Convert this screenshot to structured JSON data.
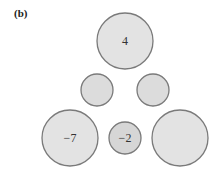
{
  "figure": {
    "label": "(b)",
    "stroke_color": "#7a7a7a",
    "fill_color": "#e2e2e2",
    "fill_color_small_dark": "#d6d6d6",
    "circles": [
      {
        "id": "top",
        "cx": 125,
        "cy": 41,
        "r": 28,
        "value": "4"
      },
      {
        "id": "middle-left",
        "cx": 97,
        "cy": 90,
        "r": 16,
        "value": ""
      },
      {
        "id": "middle-right",
        "cx": 153,
        "cy": 90,
        "r": 16,
        "value": ""
      },
      {
        "id": "bottom-left",
        "cx": 70,
        "cy": 138,
        "r": 28,
        "value": "−7"
      },
      {
        "id": "bottom-middle",
        "cx": 125,
        "cy": 138,
        "r": 16,
        "value": "−2"
      },
      {
        "id": "bottom-right",
        "cx": 180,
        "cy": 138,
        "r": 28,
        "value": ""
      }
    ]
  }
}
